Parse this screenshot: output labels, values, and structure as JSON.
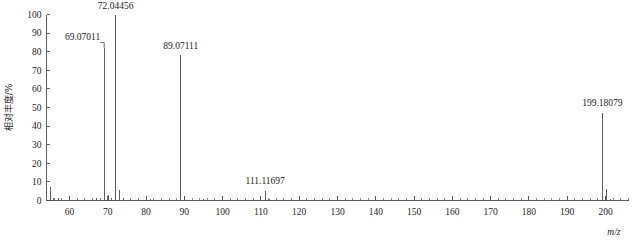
{
  "chart_data": {
    "type": "bar",
    "title": "",
    "subtitle": "",
    "xlabel": "m/z",
    "ylabel": "相对丰度/%",
    "xlim": [
      54,
      206
    ],
    "ylim": [
      0,
      100
    ],
    "grid": false,
    "legend": "none",
    "x_ticks": [
      60,
      70,
      80,
      90,
      100,
      110,
      120,
      130,
      140,
      150,
      160,
      170,
      180,
      190,
      200
    ],
    "x_tick_labels": [
      "60",
      "70",
      "80",
      "90",
      "100",
      "110",
      "120",
      "130",
      "140",
      "150",
      "160",
      "170",
      "180",
      "190",
      "200"
    ],
    "x_minor_tick_step": 2,
    "y_ticks": [
      0,
      10,
      20,
      30,
      40,
      50,
      60,
      70,
      80,
      90,
      100
    ],
    "y_tick_labels": [
      "0",
      "10",
      "20",
      "30",
      "40",
      "50",
      "60",
      "70",
      "80",
      "90",
      "100"
    ],
    "x": [
      55.05,
      55.95,
      57.07,
      67.05,
      69.07,
      70.07,
      71.05,
      72.04,
      73.05,
      74.0,
      81.07,
      89.07,
      90.07,
      95.08,
      111.12,
      112.12,
      199.18,
      200.19,
      201.19
    ],
    "values": [
      7.0,
      1.6,
      1.2,
      1.5,
      82.0,
      3.0,
      1.4,
      100.0,
      5.5,
      1.2,
      0.9,
      78.0,
      2.5,
      0.8,
      5.0,
      0.8,
      47.0,
      6.0,
      0.9
    ],
    "labeled_peaks": [
      {
        "mz": 69.07011,
        "label": "69.07011",
        "intensity": 82.0
      },
      {
        "mz": 72.04456,
        "label": "72.04456",
        "intensity": 100.0
      },
      {
        "mz": 89.07111,
        "label": "89.07111",
        "intensity": 78.0
      },
      {
        "mz": 111.11697,
        "label": "111.11697",
        "intensity": 5.0
      },
      {
        "mz": 199.18079,
        "label": "199.18079",
        "intensity": 47.0
      }
    ],
    "colors": {
      "peak": "#4b4b4b",
      "axis": "#4a4a4a",
      "text": "#1c1c1c",
      "background": "#ffffff"
    }
  }
}
